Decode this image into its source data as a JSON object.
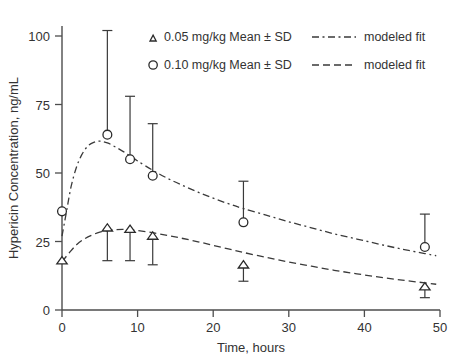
{
  "chart_data": {
    "type": "line",
    "title": "",
    "xlabel": "Time, hours",
    "ylabel": "Hypericin Concentration, ng/mL",
    "xlim": [
      0,
      50
    ],
    "ylim": [
      0,
      108
    ],
    "xticks": [
      0,
      10,
      20,
      30,
      40,
      50
    ],
    "xticklabels": [
      "0",
      "10",
      "20",
      "30",
      "40",
      "50"
    ],
    "yticks": [
      0,
      25,
      50,
      75,
      100
    ],
    "yticklabels": [
      "0",
      "25",
      "50",
      "75",
      "100"
    ],
    "grid": false,
    "legend_position": "top-center",
    "series": [
      {
        "name": "0.05 mg/kg Mean ± SD",
        "marker": "triangle",
        "fit_style": "dashed",
        "fit_label": "modeled fit",
        "x": [
          0,
          6,
          9,
          12,
          24,
          48
        ],
        "values": [
          18,
          30,
          29.5,
          27,
          16.5,
          8.5
        ],
        "err_low": [
          0,
          12,
          11.5,
          10.5,
          6,
          4
        ],
        "err_high": [
          0,
          0,
          0,
          0,
          0,
          0
        ]
      },
      {
        "name": "0.10 mg/kg Mean ± SD",
        "marker": "circle",
        "fit_style": "dash-dot",
        "fit_label": "modeled fit",
        "x": [
          0,
          6,
          9,
          12,
          24,
          48
        ],
        "values": [
          36,
          64,
          55,
          49,
          32,
          23
        ],
        "err_low": [
          0,
          0,
          0,
          0,
          0,
          0
        ],
        "err_high": [
          0,
          38,
          23,
          19,
          15,
          12
        ]
      }
    ],
    "fit_curves": [
      {
        "name": "0.10 mg/kg modeled fit",
        "style": "dash-dot",
        "points": [
          [
            0,
            27
          ],
          [
            0.6,
            36
          ],
          [
            1.2,
            45
          ],
          [
            1.9,
            52
          ],
          [
            2.6,
            56.6
          ],
          [
            3.4,
            59.8
          ],
          [
            4.2,
            61.2
          ],
          [
            5,
            61.6
          ],
          [
            6,
            61
          ],
          [
            7,
            59.6
          ],
          [
            8,
            58
          ],
          [
            9,
            56.2
          ],
          [
            10,
            54.4
          ],
          [
            12,
            51
          ],
          [
            14,
            48
          ],
          [
            16,
            45.4
          ],
          [
            18,
            43
          ],
          [
            20,
            40.8
          ],
          [
            22,
            38.8
          ],
          [
            24,
            37
          ],
          [
            27,
            34.6
          ],
          [
            30,
            32.2
          ],
          [
            33,
            30
          ],
          [
            36,
            27.8
          ],
          [
            39,
            25.9
          ],
          [
            42,
            24
          ],
          [
            45,
            22.2
          ],
          [
            48,
            20.6
          ],
          [
            49.5,
            19.8
          ]
        ]
      },
      {
        "name": "0.05 mg/kg modeled fit",
        "style": "dashed",
        "points": [
          [
            0,
            17.6
          ],
          [
            1,
            21
          ],
          [
            2,
            24
          ],
          [
            3,
            26
          ],
          [
            4,
            27.4
          ],
          [
            5,
            28.4
          ],
          [
            6,
            29
          ],
          [
            7,
            29.3
          ],
          [
            8,
            29.4
          ],
          [
            9,
            29.3
          ],
          [
            10,
            29
          ],
          [
            12,
            28.2
          ],
          [
            14,
            27.2
          ],
          [
            16,
            26.1
          ],
          [
            18,
            24.9
          ],
          [
            20,
            23.6
          ],
          [
            22,
            22.3
          ],
          [
            24,
            21
          ],
          [
            27,
            19.2
          ],
          [
            30,
            17.5
          ],
          [
            33,
            16
          ],
          [
            36,
            14.5
          ],
          [
            39,
            13.2
          ],
          [
            42,
            12
          ],
          [
            45,
            10.9
          ],
          [
            48,
            9.9
          ],
          [
            49.5,
            9.4
          ]
        ]
      }
    ]
  },
  "legend": {
    "entries": [
      {
        "marker_name": "triangle-marker",
        "label": "0.05 mg/kg Mean ± SD",
        "line_name": "dash-dot-line",
        "fit_label": "modeled fit"
      },
      {
        "marker_name": "circle-marker",
        "label": "0.10 mg/kg Mean ± SD",
        "line_name": "dashed-line",
        "fit_label": "modeled fit"
      }
    ]
  },
  "colors": {
    "axis": "#4d4d4d",
    "text": "#333333",
    "curve": "#3a3a3a",
    "marker_stroke": "#2b2b2b",
    "background": "#ffffff"
  }
}
